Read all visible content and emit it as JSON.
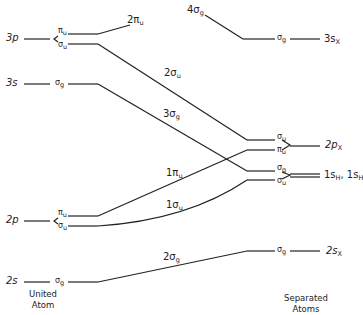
{
  "diagram": {
    "left_column_label": "United Atom",
    "right_column_label": "Separated Atoms",
    "united_atom_levels": [
      {
        "orbital": "3p",
        "split": [
          "πu",
          "σu"
        ]
      },
      {
        "orbital": "3s",
        "split": [
          "σg"
        ]
      },
      {
        "orbital": "2p",
        "split": [
          "πu",
          "σu"
        ]
      },
      {
        "orbital": "2s",
        "split": [
          "σg"
        ]
      }
    ],
    "separated_atom_levels": [
      {
        "orbital": "3sX",
        "symmetry": [
          "σg"
        ]
      },
      {
        "orbital": "2pX",
        "symmetry": [
          "σu",
          "πu"
        ]
      },
      {
        "orbital": "1sH, 1sH",
        "symmetry": [
          "σg",
          "σu"
        ]
      },
      {
        "orbital": "2sX",
        "symmetry": [
          "σg"
        ]
      }
    ],
    "correlation_lines": [
      {
        "mo": "2πu",
        "from": "3p πu",
        "to": "higher (off diagram)"
      },
      {
        "mo": "4σg",
        "from": "higher",
        "to": "3sX σg"
      },
      {
        "mo": "2σu",
        "from": "3p σu",
        "to": "2pX σu"
      },
      {
        "mo": "3σg",
        "from": "3s σg",
        "to": "1sH σg"
      },
      {
        "mo": "1πu",
        "from": "2p πu",
        "to": "2pX πu"
      },
      {
        "mo": "1σu",
        "from": "2p σu",
        "to": "1sH σu"
      },
      {
        "mo": "2σg",
        "from": "2s σg",
        "to": "2sX σg"
      }
    ]
  },
  "labels": {
    "ua_3p": "3p",
    "ua_3p_pi": "π",
    "ua_3p_pi_sub": "u",
    "ua_3p_sig": "σ",
    "ua_3p_sig_sub": "u",
    "mo_2piu": "2π",
    "mo_2piu_sub": "u",
    "mo_4sg": "4σ",
    "mo_4sg_sub": "g",
    "sa_3s_sig": "σ",
    "sa_3s_sig_sub": "g",
    "sa_3sx": "3s",
    "sa_3sx_sub": "X",
    "ua_3s": "3s",
    "ua_3s_sig": "σ",
    "ua_3s_sig_sub": "g",
    "mo_2su": "2σ",
    "mo_2su_sub": "u",
    "mo_3sg": "3σ",
    "mo_3sg_sub": "g",
    "mo_1piu": "1π",
    "mo_1piu_sub": "u",
    "mo_1su": "1σ",
    "mo_1su_sub": "u",
    "sa_2p_sig": "σ",
    "sa_2p_sig_sub": "u",
    "sa_2p_pi": "π",
    "sa_2p_pi_sub": "u",
    "sa_2px": "2p",
    "sa_2px_sub": "X",
    "sa_1s_sg": "σ",
    "sa_1s_sg_sub": "g",
    "sa_1s_su": "σ",
    "sa_1s_su_sub": "u",
    "sa_1sh_a": "1s",
    "sa_1sh_a_sub": "H",
    "sa_1sh_sep": ", ",
    "sa_1sh_b": "1s",
    "sa_1sh_b_sub": "H",
    "ua_2p": "2p",
    "ua_2p_pi": "π",
    "ua_2p_pi_sub": "u",
    "ua_2p_sig": "σ",
    "ua_2p_sig_sub": "u",
    "ua_2s": "2s",
    "ua_2s_sig": "σ",
    "ua_2s_sig_sub": "g",
    "mo_2sg": "2σ",
    "mo_2sg_sub": "g",
    "sa_2s_sig": "σ",
    "sa_2s_sig_sub": "g",
    "sa_2sx": "2s",
    "sa_2sx_sub": "X",
    "united_1": "United",
    "united_2": "Atom",
    "separated_1": "Separated",
    "separated_2": "Atoms"
  }
}
